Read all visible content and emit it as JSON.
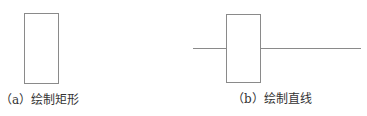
{
  "figures": [
    {
      "id": "a",
      "caption": "（a）绘制矩形"
    },
    {
      "id": "b",
      "caption": "（b）绘制直线"
    }
  ],
  "colors": {
    "stroke": "#8a8a8a",
    "text": "#333333"
  }
}
